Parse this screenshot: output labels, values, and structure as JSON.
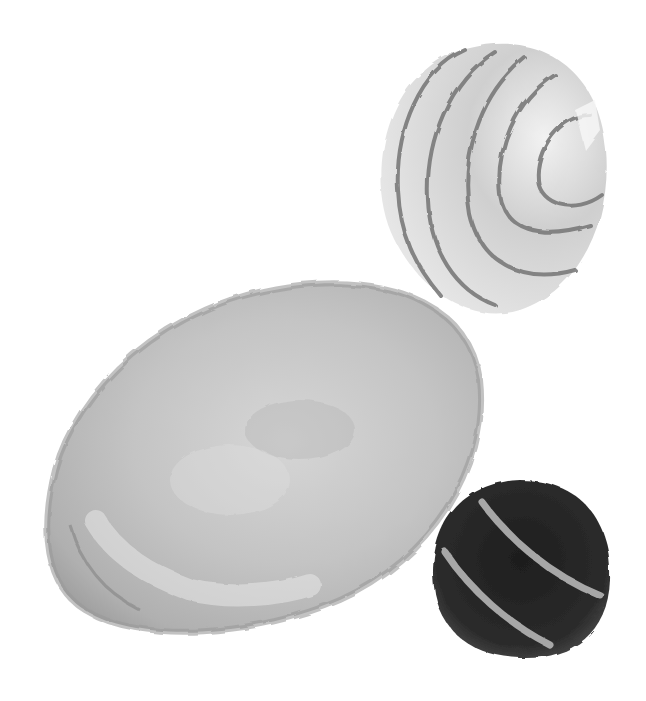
{
  "scene": {
    "background": "#ffffff",
    "style": "grayscale watercolor illustration",
    "stones": [
      {
        "name": "striped-cone-stone",
        "fill": "#d9d9d9",
        "stripe_color": "#7a7a7a"
      },
      {
        "name": "large-oval-stone",
        "fill": "#bdbdbd",
        "edge_color": "#8f8f8f"
      },
      {
        "name": "dark-round-stone",
        "fill": "#2b2b2b",
        "stripe_color": "#b5b5b5"
      }
    ]
  }
}
